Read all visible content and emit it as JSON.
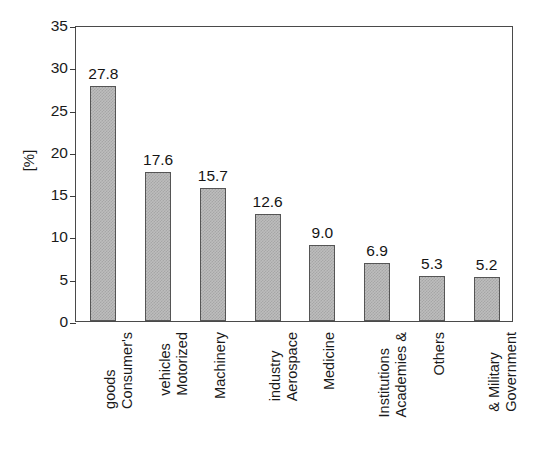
{
  "chart_data": {
    "type": "bar",
    "title": "",
    "subtitle": "",
    "xlabel": "",
    "ylabel": "[%]",
    "ylim": [
      0,
      35
    ],
    "yticks": [
      0,
      5,
      10,
      15,
      20,
      25,
      30,
      35
    ],
    "ytick_labels": [
      "0",
      "5",
      "10",
      "15",
      "20",
      "25",
      "30",
      "35"
    ],
    "grid": false,
    "legend": null,
    "bar_color": "#bdbdbd",
    "bar_edge_color": "#555555",
    "axis_color": "#4a4a4a",
    "categories": [
      "Consumer's goods",
      "Motorized vehicles",
      "Machinery",
      "Aerospace industry",
      "Medicine",
      "Academies & Institutions",
      "Others",
      "Government & Military"
    ],
    "category_lines": [
      [
        "Consumer's",
        "goods"
      ],
      [
        "Motorized",
        "vehicles"
      ],
      [
        "Machinery"
      ],
      [
        "Aerospace",
        "industry"
      ],
      [
        "Medicine"
      ],
      [
        "Academies &",
        "Institutions"
      ],
      [
        "Others"
      ],
      [
        "Government",
        "& Military"
      ]
    ],
    "values": [
      27.8,
      17.6,
      15.7,
      12.6,
      9.0,
      6.9,
      5.3,
      5.2
    ],
    "value_labels": [
      "27.8",
      "17.6",
      "15.7",
      "12.6",
      "9.0",
      "6.9",
      "5.3",
      "5.2"
    ]
  }
}
